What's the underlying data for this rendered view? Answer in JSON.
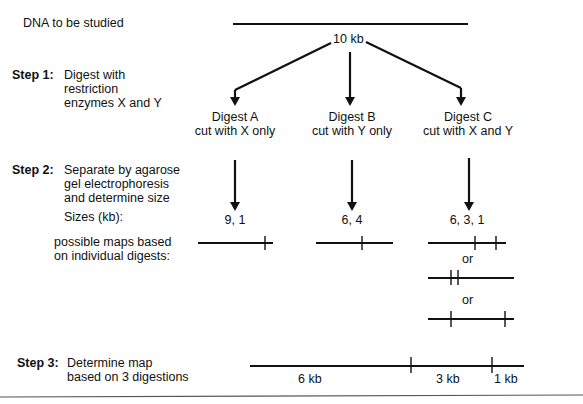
{
  "top": {
    "label": "DNA to be studied",
    "length_label": "10 kb"
  },
  "steps": [
    {
      "label": "Step 1:",
      "lines": [
        "Digest with",
        "restriction",
        "enzymes X and Y"
      ]
    },
    {
      "label": "Step 2:",
      "lines": [
        "Separate by agarose",
        "gel electrophoresis",
        "and determine size"
      ]
    },
    {
      "label": "Step 3:",
      "lines": [
        "Determine map",
        "based on 3 digestions"
      ]
    }
  ],
  "digests": [
    {
      "name": "Digest A",
      "desc": "cut with X only",
      "sizes": "9, 1"
    },
    {
      "name": "Digest B",
      "desc": "cut with Y only",
      "sizes": "6, 4"
    },
    {
      "name": "Digest C",
      "desc": "cut with X and Y",
      "sizes": "6, 3, 1"
    }
  ],
  "sizes_label": "Sizes (kb):",
  "maps_label": [
    "possible maps based",
    "on individual digests:"
  ],
  "or_label": "or",
  "final_map": {
    "segments": [
      "6 kb",
      "3 kb",
      "1 kb"
    ]
  }
}
